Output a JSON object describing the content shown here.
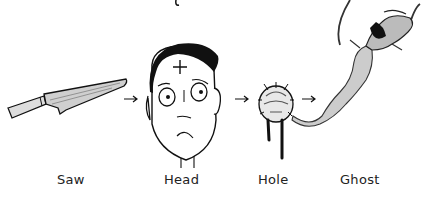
{
  "comic": {
    "labels": {
      "saw": "Saw",
      "head": "Head",
      "hole": "Hole",
      "ghost": "Ghost"
    },
    "sequence": [
      "knife",
      "head",
      "hole",
      "ghost"
    ],
    "colors": {
      "ink": "#111111",
      "shade": "#888888",
      "background": "#ffffff"
    }
  }
}
